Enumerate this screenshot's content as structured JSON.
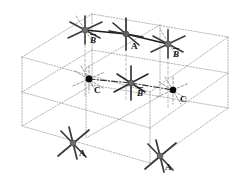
{
  "figure": {
    "background_color": "#ffffff",
    "width": 252,
    "height": 188,
    "colors": {
      "box_edge": "#8a8a8a",
      "star_gray": "#6e6e6e",
      "star_dark": "#2b2b2b",
      "node_black": "#0a0a0a",
      "bond_solid": "#1a1a1a",
      "bond_dashed": "#3a3a3a",
      "label": "#111111"
    },
    "box": {
      "name": "wireframe-parallelepiped",
      "line_style": "dotted",
      "vertices": {
        "front_top_left": [
          22,
          57
        ],
        "front_top_right": [
          150,
          92
        ],
        "back_top_right": [
          228,
          37
        ],
        "back_top_left": [
          92,
          14
        ],
        "front_bottom_left": [
          22,
          126
        ],
        "front_bottom_right": [
          150,
          163
        ],
        "back_bottom_right": [
          228,
          108
        ],
        "back_bottom_left": [
          92,
          85
        ]
      }
    },
    "layers": [
      {
        "name": "top-layer",
        "bond_style": "solid",
        "nodes": [
          {
            "id": "top-left",
            "label": "B",
            "overbar": true,
            "shape": "star",
            "fill": "#6e6e6e",
            "x": 85,
            "y": 30
          },
          {
            "id": "top-center",
            "label": "A",
            "overbar": false,
            "shape": "star",
            "fill": "#6e6e6e",
            "x": 126,
            "y": 34
          },
          {
            "id": "top-right",
            "label": "B",
            "overbar": true,
            "shape": "star",
            "fill": "#6e6e6e",
            "x": 168,
            "y": 44
          }
        ]
      },
      {
        "name": "middle-layer",
        "bond_style": "dash-dot",
        "nodes": [
          {
            "id": "mid-left",
            "label": "C",
            "overbar": false,
            "shape": "dot",
            "fill": "#0a0a0a",
            "x": 89,
            "y": 79
          },
          {
            "id": "mid-center",
            "label": "B",
            "overbar": true,
            "shape": "star",
            "fill": "#6e6e6e",
            "x": 131,
            "y": 83
          },
          {
            "id": "mid-right",
            "label": "C",
            "overbar": false,
            "shape": "dot",
            "fill": "#0a0a0a",
            "x": 173,
            "y": 90
          }
        ]
      },
      {
        "name": "bottom-layer",
        "bond_style": "none",
        "nodes": [
          {
            "id": "bot-left",
            "label": "A",
            "overbar": false,
            "shape": "star",
            "fill": "#6e6e6e",
            "x": 73,
            "y": 143
          },
          {
            "id": "bot-right",
            "label": "A",
            "overbar": false,
            "shape": "star",
            "fill": "#6e6e6e",
            "x": 160,
            "y": 156
          }
        ]
      }
    ],
    "labels": [
      {
        "name": "label-top-left-B",
        "text": "B",
        "overbar": true,
        "x": 90,
        "y": 43
      },
      {
        "name": "label-top-center-A",
        "text": "A",
        "overbar": false,
        "x": 131,
        "y": 49
      },
      {
        "name": "label-top-right-B",
        "text": "B",
        "overbar": true,
        "x": 173,
        "y": 57
      },
      {
        "name": "label-mid-left-C",
        "text": "C",
        "overbar": false,
        "x": 94,
        "y": 93
      },
      {
        "name": "label-mid-center-B",
        "text": "B",
        "overbar": true,
        "x": 137,
        "y": 96
      },
      {
        "name": "label-mid-right-C",
        "text": "C",
        "overbar": false,
        "x": 180,
        "y": 102
      },
      {
        "name": "label-bot-left-A",
        "text": "A",
        "overbar": false,
        "x": 79,
        "y": 156
      },
      {
        "name": "label-bot-right-A",
        "text": "A",
        "overbar": false,
        "x": 165,
        "y": 170
      }
    ]
  }
}
